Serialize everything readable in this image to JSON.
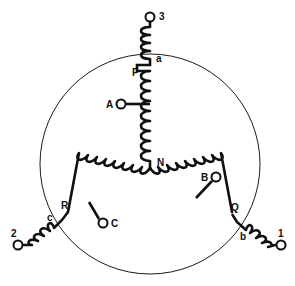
{
  "diagram": {
    "background_color": "#ffffff",
    "line_color": "#101010",
    "circle_color": "#1a1a1a",
    "stator": {
      "shape": "circle",
      "center_x": 150,
      "center_y": 164,
      "radius": 110
    },
    "star_point": {
      "id": "N",
      "label": "N",
      "x": 150,
      "y": 168
    },
    "phase_nodes": [
      {
        "id": "P",
        "label": "P",
        "x": 150,
        "y": 70
      },
      {
        "id": "Q",
        "label": "Q",
        "x": 232,
        "y": 214
      },
      {
        "id": "R",
        "label": "R",
        "x": 68,
        "y": 211
      }
    ],
    "tap_terminals": [
      {
        "id": "A",
        "label": "A",
        "cx": 119,
        "cy": 104,
        "junction_x": 150,
        "junction_y": 104
      },
      {
        "id": "B",
        "label": "B",
        "cx": 217,
        "cy": 178,
        "junction_x": 196,
        "junction_y": 198
      },
      {
        "id": "C",
        "label": "C",
        "cx": 103,
        "cy": 222,
        "junction_x": 89,
        "junction_y": 202
      }
    ],
    "line_terminals": [
      {
        "id": "3",
        "label": "3",
        "cx": 150,
        "cy": 16,
        "lead_label": "a",
        "lead_label_x": 157,
        "lead_label_y": 62
      },
      {
        "id": "1",
        "label": "1",
        "cx": 281,
        "cy": 245,
        "lead_label": "b",
        "lead_label_x": 242,
        "lead_label_y": 238
      },
      {
        "id": "2",
        "label": "2",
        "cx": 17,
        "cy": 245,
        "lead_label": "c",
        "lead_label_x": 52,
        "lead_label_y": 220
      }
    ],
    "coils": [
      {
        "id": "coil-PN",
        "from": "P",
        "to": "N",
        "phase": "A",
        "bumps": 7
      },
      {
        "id": "coil-NQ",
        "from": "N",
        "to": "Q",
        "phase": "B",
        "bumps": 7
      },
      {
        "id": "coil-NR",
        "from": "N",
        "to": "R",
        "phase": "C",
        "bumps": 7
      },
      {
        "id": "coil-a3",
        "from": "a",
        "to": "3",
        "phase": "A-lead",
        "bumps": 4
      },
      {
        "id": "coil-b1",
        "from": "b",
        "to": "1",
        "phase": "B-lead",
        "bumps": 4
      },
      {
        "id": "coil-c2",
        "from": "c",
        "to": "2",
        "phase": "C-lead",
        "bumps": 4
      }
    ]
  }
}
